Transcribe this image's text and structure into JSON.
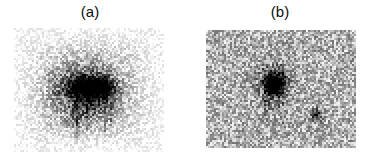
{
  "figure": {
    "name": "two-panel-grayscale-density-figure",
    "background_color": "#ffffff",
    "width": 376,
    "height": 162,
    "ink_color": "#000000",
    "caption": ""
  },
  "panels": [
    {
      "id": "panel-a",
      "label": "(a)",
      "label_x": 90,
      "label_y": 4,
      "image_x": 14,
      "image_y": 28,
      "image_w": 150,
      "image_h": 124,
      "edge_style": "feathered",
      "border": "none"
    },
    {
      "id": "panel-b",
      "label": "(b)",
      "label_x": 280,
      "label_y": 4,
      "image_x": 206,
      "image_y": 30,
      "image_w": 150,
      "image_h": 118,
      "edge_style": "hard",
      "border": "none"
    }
  ],
  "chart_data": {
    "type": "heatmap",
    "title": "",
    "subtitle": "",
    "xlabel": "",
    "ylabel": "",
    "grid": false,
    "legend_position": "none",
    "colormap": "grayscale-inverted",
    "colormap_min_label": "white (low signal)",
    "colormap_max_label": "black (high signal)",
    "annotations": [
      "(a)",
      "(b)"
    ],
    "noise": {
      "type": "halftone-dither",
      "amplitude": 0.55,
      "grain_px": 2
    },
    "panels": [
      {
        "name": "(a)",
        "grid_cols": 75,
        "grid_rows": 62,
        "xlim": [
          0,
          75
        ],
        "ylim": [
          0,
          62
        ],
        "background_level": 0.06,
        "envelope": {
          "type": "gaussian",
          "cx": 36,
          "cy": 32,
          "sx": 22,
          "sy": 19,
          "amp": 0.3
        },
        "blobs": [
          {
            "cx": 33,
            "cy": 30,
            "sx": 14,
            "sy": 10,
            "amp": 0.34,
            "angle": 0
          },
          {
            "cx": 38,
            "cy": 29,
            "sx": 9,
            "sy": 5.5,
            "amp": 0.52,
            "angle": 0
          },
          {
            "cx": 44,
            "cy": 29,
            "sx": 5,
            "sy": 4.0,
            "amp": 0.72,
            "angle": 0
          },
          {
            "cx": 34,
            "cy": 29,
            "sx": 5,
            "sy": 3.2,
            "amp": 0.55,
            "angle": 0
          },
          {
            "cx": 40,
            "cy": 37,
            "sx": 7,
            "sy": 6.0,
            "amp": 0.22,
            "angle": 0
          },
          {
            "cx": 30,
            "cy": 44,
            "sx": 6,
            "sy": 6.0,
            "amp": 0.14,
            "angle": 0
          }
        ],
        "streaks": [
          {
            "x": 31,
            "y0": 24,
            "y1": 55,
            "w": 1.0,
            "amp": 0.2
          },
          {
            "x": 45,
            "y0": 24,
            "y1": 52,
            "w": 1.0,
            "amp": 0.22
          },
          {
            "x": 48,
            "y0": 26,
            "y1": 48,
            "w": 0.8,
            "amp": 0.16
          },
          {
            "x": 36,
            "y0": 26,
            "y1": 50,
            "w": 0.8,
            "amp": 0.14
          }
        ],
        "peak_value": 0.88,
        "mean_value": 0.13
      },
      {
        "name": "(b)",
        "grid_cols": 75,
        "grid_rows": 59,
        "xlim": [
          0,
          75
        ],
        "ylim": [
          0,
          59
        ],
        "background_level": 0.16,
        "envelope": {
          "type": "uniform",
          "cx": 37,
          "cy": 29,
          "sx": 60,
          "sy": 48,
          "amp": 0.1
        },
        "blobs": [
          {
            "cx": 33,
            "cy": 26,
            "sx": 8.0,
            "sy": 8.0,
            "amp": 0.34,
            "angle": 0
          },
          {
            "cx": 34,
            "cy": 26,
            "sx": 4.5,
            "sy": 5.5,
            "amp": 0.62,
            "angle": 0
          },
          {
            "cx": 33,
            "cy": 28,
            "sx": 2.6,
            "sy": 3.4,
            "amp": 0.78,
            "angle": 0
          },
          {
            "cx": 55,
            "cy": 42,
            "sx": 2.6,
            "sy": 3.2,
            "amp": 0.55,
            "angle": 0
          },
          {
            "cx": 31,
            "cy": 38,
            "sx": 3.0,
            "sy": 4.0,
            "amp": 0.16,
            "angle": 0
          }
        ],
        "streaks": [
          {
            "x": 29,
            "y0": 16,
            "y1": 44,
            "w": 0.9,
            "amp": 0.14
          },
          {
            "x": 38,
            "y0": 16,
            "y1": 46,
            "w": 0.9,
            "amp": 0.16
          },
          {
            "x": 36,
            "y0": 20,
            "y1": 40,
            "w": 0.7,
            "amp": 0.12
          }
        ],
        "peak_value": 0.85,
        "mean_value": 0.22
      }
    ]
  }
}
